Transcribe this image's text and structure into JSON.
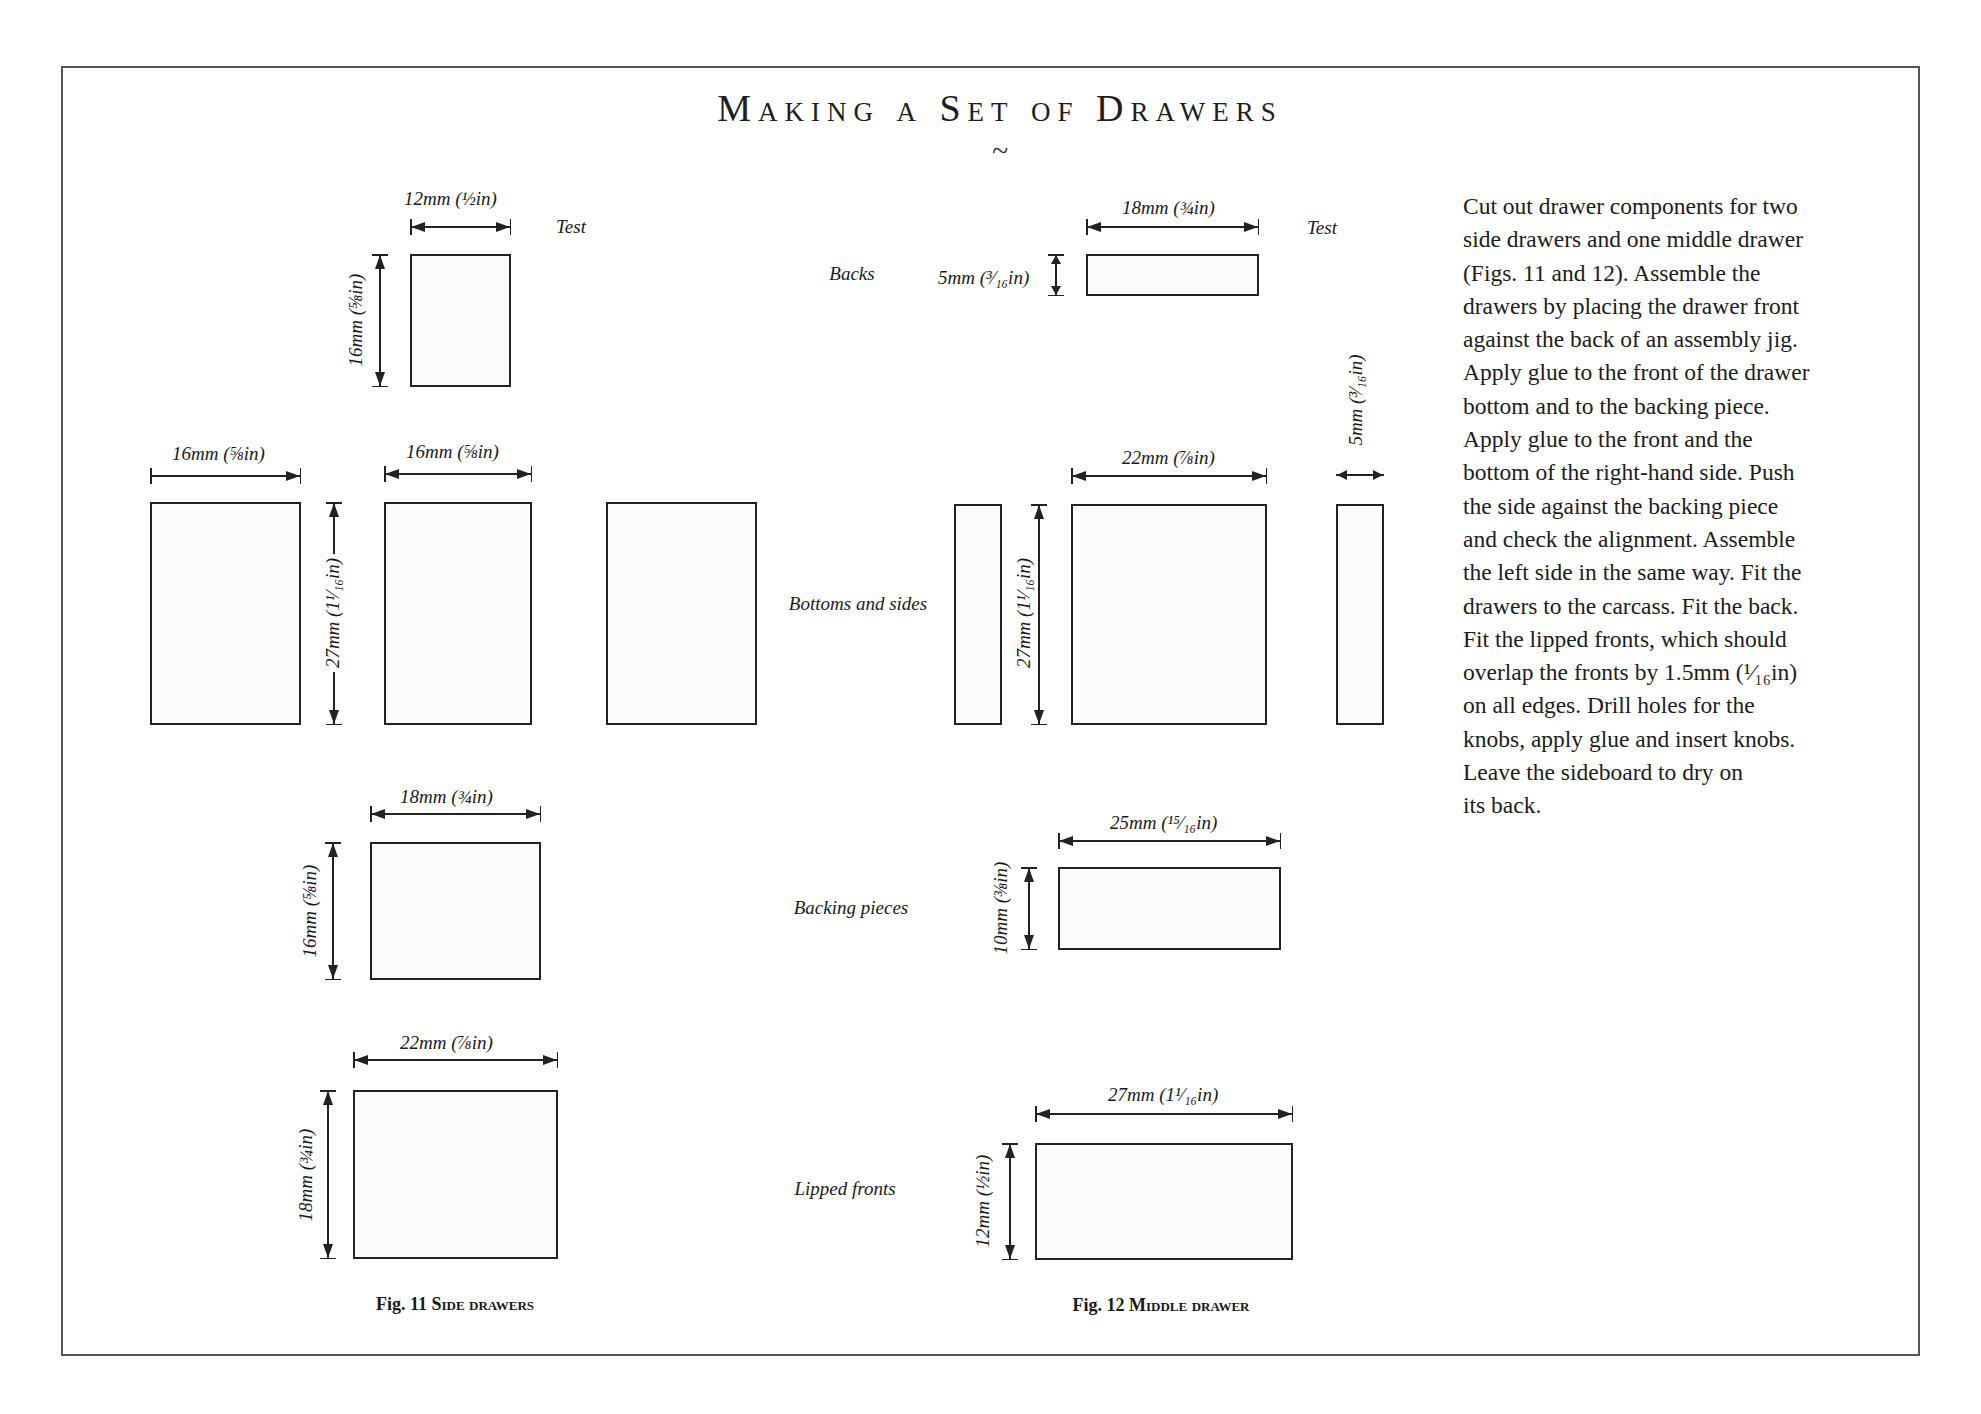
{
  "page": {
    "title": "Making a Set of Drawers",
    "ornament": "~"
  },
  "row_labels": {
    "backs": "Backs",
    "bottoms_and_sides": "Bottoms and sides",
    "backing_pieces": "Backing pieces",
    "lipped_fronts": "Lipped fronts"
  },
  "fig11": {
    "caption_prefix": "Fig. 11",
    "caption_title": "Side drawers",
    "back": {
      "width_label": "12mm (½in)",
      "height_label": "16mm (⅝in)",
      "test_label": "Test"
    },
    "bottoms_sides": {
      "width_label_1": "16mm (⅝in)",
      "width_label_2": "16mm (⅝in)",
      "height_label": "27mm (1¹⁄₁₆in)"
    },
    "backing_piece": {
      "width_label": "18mm (¾in)",
      "height_label": "16mm (⅝in)"
    },
    "lipped_front": {
      "width_label": "22mm (⅞in)",
      "height_label": "18mm (¾in)"
    }
  },
  "fig12": {
    "caption_prefix": "Fig. 12",
    "caption_title": "Middle drawer",
    "back": {
      "width_label": "18mm (¾in)",
      "height_label": "5mm (³⁄₁₆in)",
      "test_label": "Test"
    },
    "bottoms_sides": {
      "width_label": "22mm (⅞in)",
      "height_label": "27mm (1¹⁄₁₆in)",
      "side_width_label": "5mm (³⁄₁₆in)"
    },
    "backing_piece": {
      "width_label": "25mm (¹⁵⁄₁₆in)",
      "height_label": "10mm (⅜in)"
    },
    "lipped_front": {
      "width_label": "27mm (1¹⁄₁₆in)",
      "height_label": "12mm (½in)"
    }
  },
  "instructions": {
    "lines": [
      "Cut out drawer components for two",
      "side drawers and one middle drawer",
      "(Figs. 11 and 12). Assemble the",
      "drawers by placing the drawer front",
      "against the back of an assembly jig.",
      "Apply glue to the front of the drawer",
      "bottom and to the backing piece.",
      "Apply glue to the front and the",
      "bottom of the right-hand side. Push",
      "the side against the backing piece",
      "and check the alignment. Assemble",
      "the left side in the same way. Fit the",
      "drawers to the carcass. Fit the back.",
      "Fit the lipped fronts, which should",
      "overlap the fronts by 1.5mm (¹⁄₁₆in)",
      "on all edges. Drill holes for the",
      "knobs, apply glue and insert knobs.",
      "Leave the sideboard to dry on",
      "its back."
    ]
  }
}
